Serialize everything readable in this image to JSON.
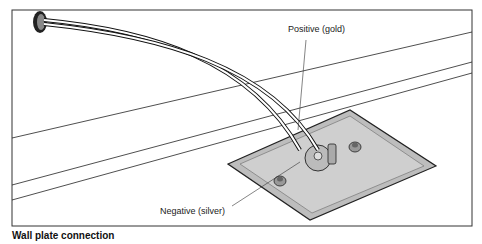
{
  "figure": {
    "labels": {
      "positive": "Positive (gold)",
      "negative": "Negative (silver)"
    },
    "caption": "Wall plate connection",
    "colors": {
      "line": "#1a1a1a",
      "plate_fill": "#c8c8c8",
      "plate_edge": "#9a9a9a",
      "background": "#ffffff"
    }
  }
}
